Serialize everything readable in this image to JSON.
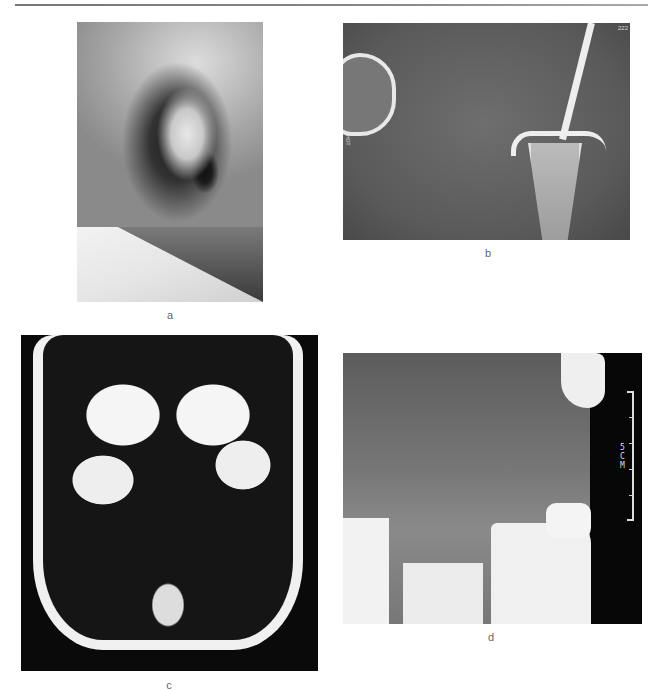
{
  "figure": {
    "panels": [
      {
        "id": "a",
        "label": "a",
        "description": "Photograph of infant ear, lateral view"
      },
      {
        "id": "b",
        "label": "b",
        "description": "CT image, temporomandibular region",
        "overlay_left": "HOT",
        "overlay_top_right": "222"
      },
      {
        "id": "c",
        "label": "c",
        "description": "Coronal MRI of head"
      },
      {
        "id": "d",
        "label": "d",
        "description": "MRI with scale bar",
        "scale_text": "5CM"
      }
    ]
  },
  "colors": {
    "page": "#ffffff",
    "rule": "#808080",
    "label": "#666666"
  }
}
